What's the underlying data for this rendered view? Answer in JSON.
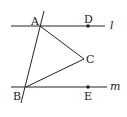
{
  "diagram": {
    "points": {
      "A": {
        "label": "A",
        "x": 40,
        "y": 26
      },
      "B": {
        "label": "B",
        "x": 26,
        "y": 87
      },
      "C": {
        "label": "C",
        "x": 84,
        "y": 59
      },
      "D": {
        "label": "D",
        "x": 88,
        "y": 26
      },
      "E": {
        "label": "E",
        "x": 88,
        "y": 87
      }
    },
    "lines": {
      "l": {
        "label": "l"
      },
      "m": {
        "label": "m"
      }
    },
    "colors": {
      "stroke": "#222222",
      "background": "#ffffff"
    }
  }
}
